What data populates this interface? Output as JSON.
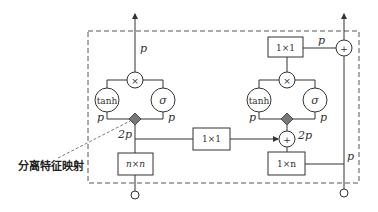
{
  "diagram": {
    "annotation": "分离特征映射",
    "left_block": {
      "output_label": "p",
      "mul_op": "×",
      "tanh_label": "tanh",
      "sigma_label": "σ",
      "tanh_p": "p",
      "sigma_p": "p",
      "split_label": "2p",
      "conv_label": "n×n"
    },
    "middle": {
      "conv_label": "1×1"
    },
    "right_block": {
      "top_conv_label": "1×1",
      "top_p": "p",
      "add_out_op": "+",
      "mul_op": "×",
      "tanh_label": "tanh",
      "sigma_label": "σ",
      "tanh_p": "p",
      "sigma_p": "p",
      "add_op": "+",
      "add_label": "2p",
      "conv_label": "1×n",
      "residual_p": "p"
    },
    "colors": {
      "line": "#333333",
      "diamond": "#777777",
      "dash": "#555555"
    }
  }
}
